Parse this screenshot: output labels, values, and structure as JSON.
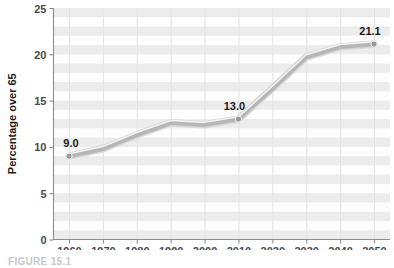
{
  "figure": {
    "caption": "FIGURE 15.1"
  },
  "chart_data": {
    "type": "line",
    "title": "",
    "xlabel": "",
    "ylabel": "Percentage over 65",
    "categories": [
      "1960",
      "1970",
      "1980",
      "1990",
      "2000",
      "2010",
      "2020",
      "2030",
      "2040",
      "2050"
    ],
    "x": [
      1960,
      1970,
      1980,
      1990,
      2000,
      2010,
      2020,
      2030,
      2040,
      2050
    ],
    "values": [
      9.0,
      9.8,
      11.3,
      12.6,
      12.4,
      13.0,
      16.3,
      19.7,
      20.8,
      21.1
    ],
    "point_labels": [
      {
        "category": "1960",
        "value": 9.0,
        "text": "9.0"
      },
      {
        "category": "2010",
        "value": 13.0,
        "text": "13.0"
      },
      {
        "category": "2050",
        "value": 21.1,
        "text": "21.1"
      }
    ],
    "markers": [
      "1960",
      "2010",
      "2050"
    ],
    "ylim": [
      0,
      25
    ],
    "yticks": [
      0,
      5,
      10,
      15,
      20,
      25
    ],
    "ytick_labels": [
      "0",
      "5",
      "10",
      "15",
      "20",
      "25"
    ],
    "xtick_labels": [
      "1960",
      "1970",
      "1980",
      "1990",
      "2000",
      "2010",
      "2020",
      "2030",
      "2040",
      "2050"
    ],
    "grid": {
      "horizontal_bands": true,
      "vertical_lines": true
    },
    "legend": {
      "visible": false,
      "position": "none"
    },
    "colors": {
      "line": "#b6b6b6",
      "line_highlight": "#f4f4f4",
      "marker": "#9a9a9a",
      "band": "#ececec",
      "gridline": "#e3e3e3",
      "axis": "#8d8d8d",
      "text": "#1a1a1a"
    }
  }
}
